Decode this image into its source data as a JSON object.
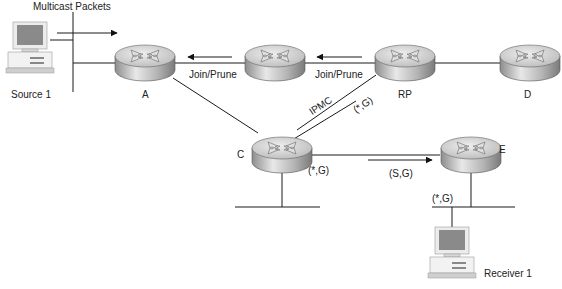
{
  "diagram": {
    "type": "PIM sparse-mode multicast network",
    "nodes": {
      "source": {
        "label": "Source 1",
        "kind": "host"
      },
      "receiver": {
        "label": "Receiver 1",
        "kind": "host"
      },
      "router_a": {
        "label": "A",
        "kind": "router"
      },
      "router_b": {
        "label": "",
        "kind": "router"
      },
      "router_rp": {
        "label": "RP",
        "kind": "router"
      },
      "router_d": {
        "label": "D",
        "kind": "router"
      },
      "router_c": {
        "label": "C",
        "kind": "router"
      },
      "router_e": {
        "label": "E",
        "kind": "router"
      }
    },
    "labels": {
      "multicast_packets": "Multicast Packets",
      "join_prune_1": "Join/Prune",
      "join_prune_2": "Join/Prune",
      "ipmc": "IPMC",
      "star_g_rp": "(*,G)",
      "star_g_c": "(*,G)",
      "s_g": "(S,G)",
      "star_g_e": "(*,G)"
    },
    "colors": {
      "line": "#1a1a1a",
      "router_top": "#d0d0d0",
      "router_side": "#a8a8a8",
      "monitor_screen": "#8a8a8a"
    }
  }
}
